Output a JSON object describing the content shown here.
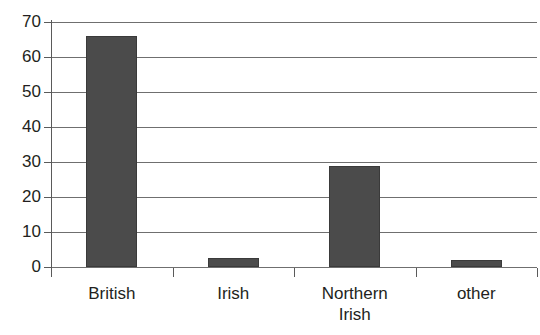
{
  "chart_data": {
    "type": "bar",
    "title": "",
    "xlabel": "",
    "ylabel": "",
    "categories": [
      "British",
      "Irish",
      "Northern Irish",
      "other"
    ],
    "category_lines": [
      [
        "British"
      ],
      [
        "Irish"
      ],
      [
        "Northern",
        "Irish"
      ],
      [
        "other"
      ]
    ],
    "values": [
      66,
      2.7,
      29,
      2
    ],
    "ylim": [
      0,
      70
    ],
    "yticks": [
      0,
      10,
      20,
      30,
      40,
      50,
      60,
      70
    ],
    "ytick_labels": [
      "0",
      "10",
      "20",
      "30",
      "40",
      "50",
      "60",
      "70"
    ],
    "grid": "horizontal",
    "legend": "none",
    "bar_color": "#4b4b4b",
    "axis_color": "#5a5a5a",
    "gridline_color": "#6f6f6f",
    "text_color": "#231f20"
  }
}
